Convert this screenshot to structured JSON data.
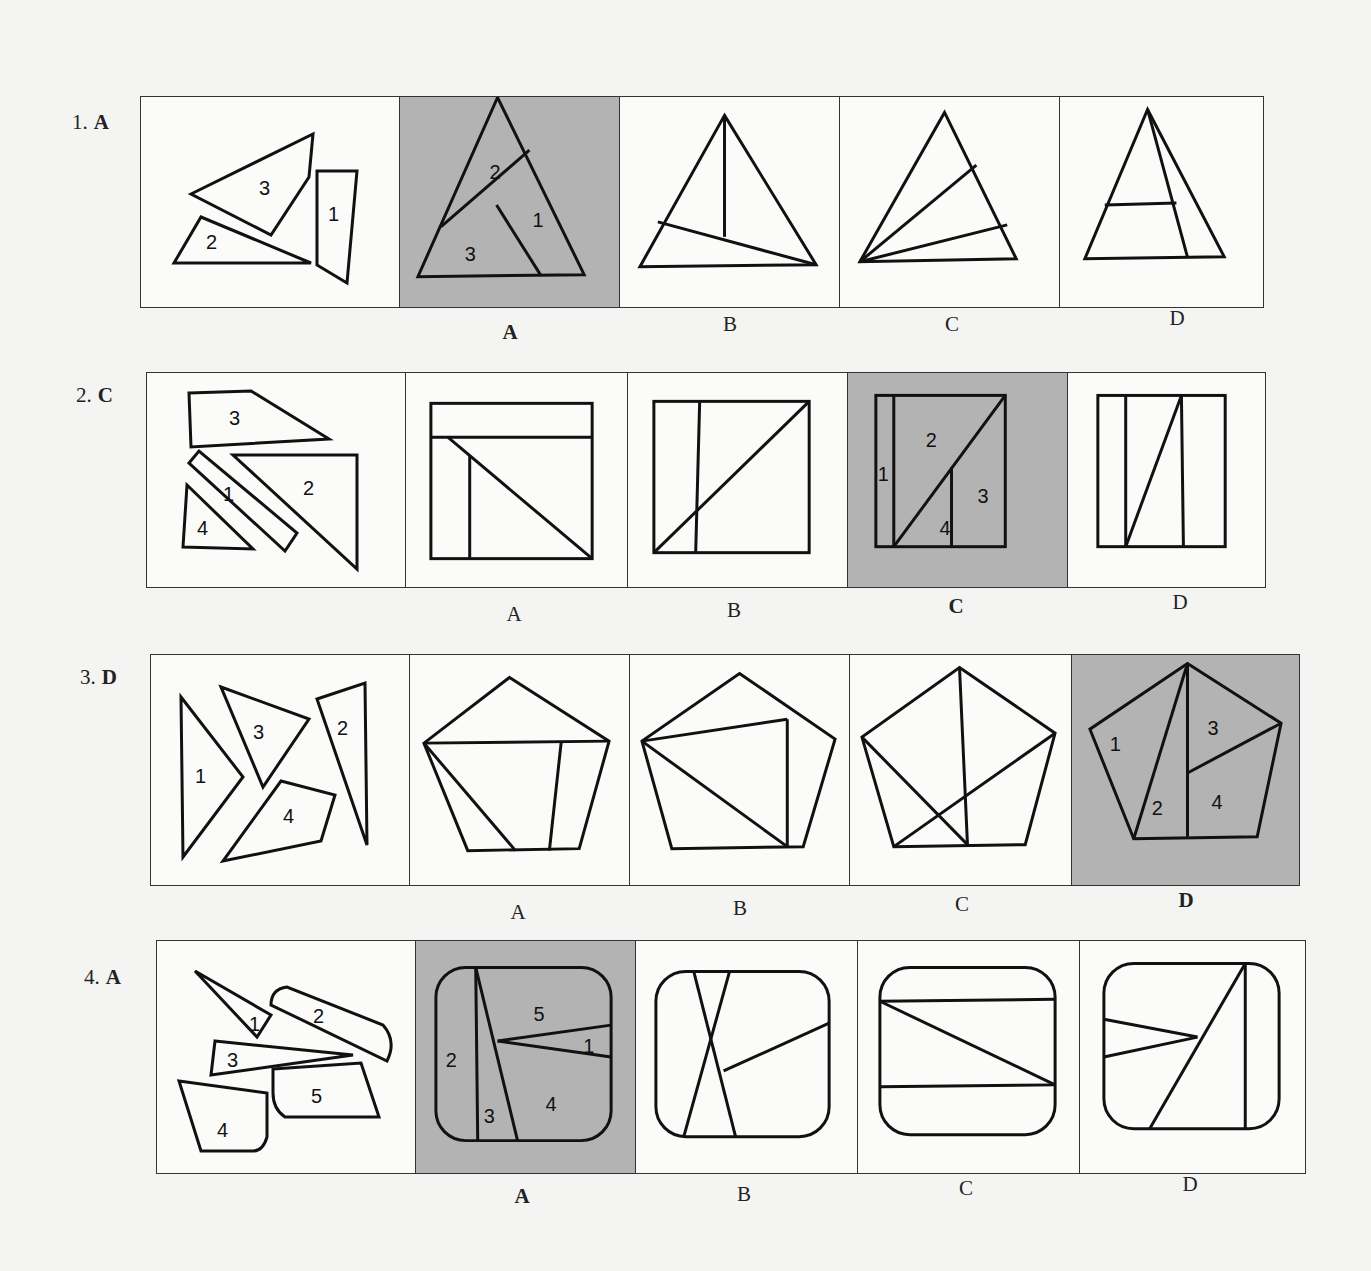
{
  "problems": [
    {
      "number": "1.",
      "answer": "A",
      "pieces_labels": [
        "1",
        "2",
        "3"
      ],
      "option_labels": [
        "A",
        "B",
        "C",
        "D"
      ],
      "correct_option": "A",
      "solution_piece_labels": [
        "2",
        "1",
        "3"
      ]
    },
    {
      "number": "2.",
      "answer": "C",
      "pieces_labels": [
        "3",
        "1",
        "2",
        "4"
      ],
      "option_labels": [
        "A",
        "B",
        "C",
        "D"
      ],
      "correct_option": "C",
      "solution_piece_labels": [
        "2",
        "1",
        "3",
        "4"
      ]
    },
    {
      "number": "3.",
      "answer": "D",
      "pieces_labels": [
        "3",
        "2",
        "1",
        "4"
      ],
      "option_labels": [
        "A",
        "B",
        "C",
        "D"
      ],
      "correct_option": "D",
      "solution_piece_labels": [
        "1",
        "3",
        "2",
        "4"
      ]
    },
    {
      "number": "4.",
      "answer": "A",
      "pieces_labels": [
        "1",
        "2",
        "3",
        "5",
        "4"
      ],
      "option_labels": [
        "A",
        "B",
        "C",
        "D"
      ],
      "correct_option": "A",
      "solution_piece_labels": [
        "5",
        "2",
        "1",
        "3",
        "4"
      ]
    }
  ],
  "colors": {
    "shade": "#b3b3b3",
    "line": "#111111",
    "background": "#f4f4f2"
  }
}
